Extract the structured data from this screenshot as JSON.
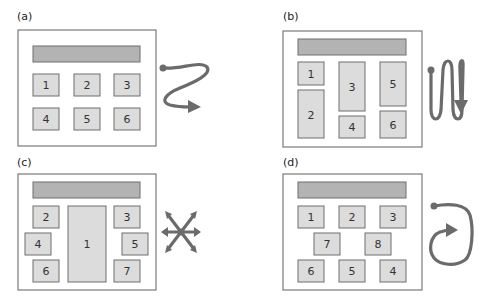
{
  "panels": [
    {
      "label": "(a)",
      "pattern": "row-by-row Z scan",
      "boxes": [
        {
          "label": "1"
        },
        {
          "label": "2"
        },
        {
          "label": "3"
        },
        {
          "label": "4"
        },
        {
          "label": "5"
        },
        {
          "label": "6"
        }
      ]
    },
    {
      "label": "(b)",
      "pattern": "column-by-column N scan",
      "boxes": [
        {
          "label": "1"
        },
        {
          "label": "2"
        },
        {
          "label": "3"
        },
        {
          "label": "4"
        },
        {
          "label": "5"
        },
        {
          "label": "6"
        }
      ]
    },
    {
      "label": "(c)",
      "pattern": "center-outward radial",
      "boxes": [
        {
          "label": "1"
        },
        {
          "label": "2"
        },
        {
          "label": "3"
        },
        {
          "label": "4"
        },
        {
          "label": "5"
        },
        {
          "label": "6"
        },
        {
          "label": "7"
        }
      ]
    },
    {
      "label": "(d)",
      "pattern": "clockwise circular",
      "boxes": [
        {
          "label": "1"
        },
        {
          "label": "2"
        },
        {
          "label": "3"
        },
        {
          "label": "4"
        },
        {
          "label": "5"
        },
        {
          "label": "6"
        },
        {
          "label": "7"
        },
        {
          "label": "8"
        }
      ]
    }
  ],
  "colors": {
    "header_fill": "#b3b3b3",
    "box_fill": "#dcdcdc",
    "arrow": "#6b6b6b"
  }
}
